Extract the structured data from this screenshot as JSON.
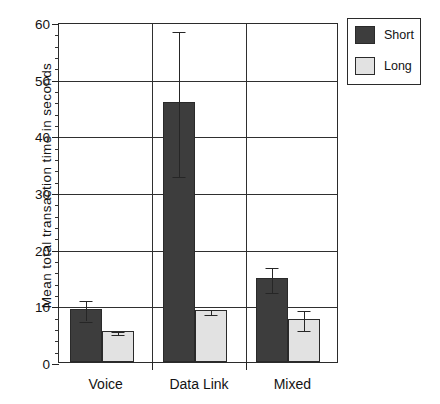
{
  "chart_data": {
    "type": "bar",
    "title": "",
    "xlabel": "",
    "ylabel": "Mean total transaction time in seconds",
    "ylim": [
      0,
      60
    ],
    "ytick_step": 10,
    "yminor_step": 2,
    "grid": "horizontal and vertical category separators",
    "legend_position": "top-right outside",
    "categories": [
      "Voice",
      "Data Link",
      "Mixed"
    ],
    "series": [
      {
        "name": "Short",
        "color": "#3d3d3d",
        "values": [
          9.3,
          45.8,
          14.8
        ],
        "errors": [
          1.8,
          12.8,
          2.2
        ]
      },
      {
        "name": "Long",
        "color": "#e2e2e2",
        "values": [
          5.4,
          9.1,
          7.6
        ],
        "errors": [
          0.3,
          0.5,
          1.7
        ]
      }
    ],
    "ytick_labels": [
      "0",
      "10",
      "20",
      "30",
      "40",
      "50",
      "60"
    ]
  },
  "axes": {
    "y_title": "Mean total transaction time in seconds",
    "y_ticks": [
      {
        "value": 60,
        "label": "60"
      },
      {
        "value": 50,
        "label": "50"
      },
      {
        "value": 40,
        "label": "40"
      },
      {
        "value": 30,
        "label": "30"
      },
      {
        "value": 20,
        "label": "20"
      },
      {
        "value": 10,
        "label": "10"
      },
      {
        "value": 0,
        "label": "0"
      }
    ],
    "x_categories": [
      {
        "label": "Voice"
      },
      {
        "label": "Data Link"
      },
      {
        "label": "Mixed"
      }
    ]
  },
  "legend": {
    "entries": [
      {
        "label": "Short",
        "color": "#3d3d3d"
      },
      {
        "label": "Long",
        "color": "#e2e2e2"
      }
    ]
  }
}
